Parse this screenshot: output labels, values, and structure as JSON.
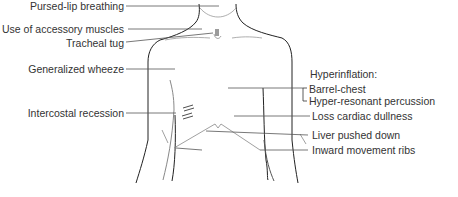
{
  "diagram": {
    "left_labels": [
      {
        "id": "pursed-lip",
        "text": "Pursed-lip breathing"
      },
      {
        "id": "accessory-muscles",
        "text": "Use of accessory muscles"
      },
      {
        "id": "tracheal-tug",
        "text": "Tracheal tug"
      },
      {
        "id": "generalized-wheeze",
        "text": "Generalized wheeze"
      },
      {
        "id": "intercostal-recession",
        "text": "Intercostal recession"
      }
    ],
    "right_heading": "Hyperinflation:",
    "right_bracket_labels": [
      {
        "id": "barrel-chest",
        "text": "Barrel-chest"
      },
      {
        "id": "hyper-resonant",
        "text": "Hyper-resonant percussion"
      }
    ],
    "right_labels": [
      {
        "id": "loss-cardiac-dullness",
        "text": "Loss cardiac dullness"
      },
      {
        "id": "liver-pushed-down",
        "text": "Liver pushed down"
      },
      {
        "id": "inward-movement-ribs",
        "text": "Inward movement ribs"
      }
    ],
    "colors": {
      "text": "#333333",
      "outline": "#222222",
      "leader": "#555555",
      "faint": "#999999"
    }
  }
}
